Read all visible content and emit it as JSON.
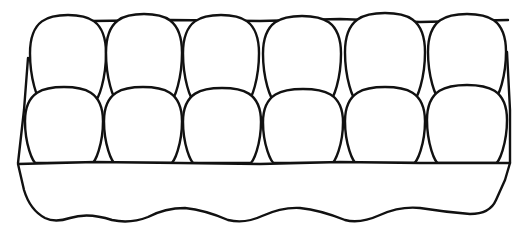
{
  "image": {
    "subject": "egg carton line drawing",
    "egg_count": 12,
    "rows": 2,
    "eggs_per_row": 6,
    "colors": {
      "stroke": "#111111",
      "fill": "#ffffff",
      "background": "#ffffff"
    }
  },
  "back_row": [
    {
      "cx": 68,
      "top": 15,
      "bottom": 100,
      "rx": 38
    },
    {
      "cx": 144,
      "top": 14,
      "bottom": 100,
      "rx": 38
    },
    {
      "cx": 221,
      "top": 15,
      "bottom": 100,
      "rx": 38
    },
    {
      "cx": 302,
      "top": 16,
      "bottom": 100,
      "rx": 39
    },
    {
      "cx": 385,
      "top": 13,
      "bottom": 100,
      "rx": 40
    },
    {
      "cx": 467,
      "top": 14,
      "bottom": 98,
      "rx": 39
    }
  ],
  "front_row": [
    {
      "cx": 64,
      "top": 87,
      "bottom": 163,
      "rx": 39
    },
    {
      "cx": 143,
      "top": 87,
      "bottom": 163,
      "rx": 39
    },
    {
      "cx": 222,
      "top": 88,
      "bottom": 163,
      "rx": 39
    },
    {
      "cx": 303,
      "top": 89,
      "bottom": 163,
      "rx": 40
    },
    {
      "cx": 385,
      "top": 87,
      "bottom": 163,
      "rx": 40
    },
    {
      "cx": 467,
      "top": 85,
      "bottom": 163,
      "rx": 40
    }
  ]
}
